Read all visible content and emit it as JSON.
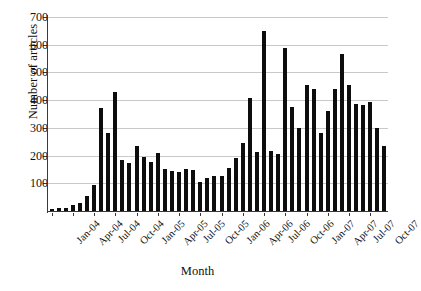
{
  "chart_data": {
    "type": "bar",
    "title": "",
    "xlabel": "Month",
    "ylabel": "Number of articles",
    "ylim": [
      0,
      700
    ],
    "ytick_values": [
      100,
      200,
      300,
      400,
      500,
      600,
      700
    ],
    "ytick_labels": [
      "100",
      "200",
      "300",
      "400",
      "500",
      "600",
      "700"
    ],
    "grid": true,
    "legend": null,
    "bar_color": "#0d0d0d",
    "x": [
      "Jan-04",
      "Feb-04",
      "Mar-04",
      "Apr-04",
      "May-04",
      "Jun-04",
      "Jul-04",
      "Aug-04",
      "Sep-04",
      "Oct-04",
      "Nov-04",
      "Dec-04",
      "Jan-05",
      "Feb-05",
      "Mar-05",
      "Apr-05",
      "May-05",
      "Jun-05",
      "Jul-05",
      "Aug-05",
      "Sep-05",
      "Oct-05",
      "Nov-05",
      "Dec-05",
      "Jan-06",
      "Feb-06",
      "Mar-06",
      "Apr-06",
      "May-06",
      "Jun-06",
      "Jul-06",
      "Aug-06",
      "Sep-06",
      "Oct-06",
      "Nov-06",
      "Dec-06",
      "Jan-07",
      "Feb-07",
      "Mar-07",
      "Apr-07",
      "May-07",
      "Jun-07",
      "Jul-07",
      "Aug-07",
      "Sep-07",
      "Oct-07",
      "Nov-07",
      "Dec-07"
    ],
    "values": [
      8,
      10,
      12,
      22,
      30,
      55,
      95,
      370,
      283,
      430,
      185,
      172,
      235,
      195,
      178,
      210,
      150,
      145,
      140,
      150,
      148,
      105,
      120,
      128,
      125,
      155,
      190,
      245,
      408,
      213,
      650,
      215,
      205,
      590,
      375,
      300,
      455,
      440,
      280,
      360,
      440,
      565,
      455,
      385,
      382,
      395,
      300,
      233
    ],
    "xtick_labels": [
      "Jan-04",
      "Apr-04",
      "Jul-04",
      "Oct-04",
      "Jan-05",
      "Apr-05",
      "Jul-05",
      "Oct-05",
      "Jan-06",
      "Apr-06",
      "Jul-06",
      "Oct-06",
      "Jan-07",
      "Apr-07",
      "Jul-07",
      "Oct-07"
    ],
    "xtick_indices": [
      0,
      3,
      6,
      9,
      12,
      15,
      18,
      21,
      24,
      27,
      30,
      33,
      36,
      39,
      42,
      45
    ]
  }
}
